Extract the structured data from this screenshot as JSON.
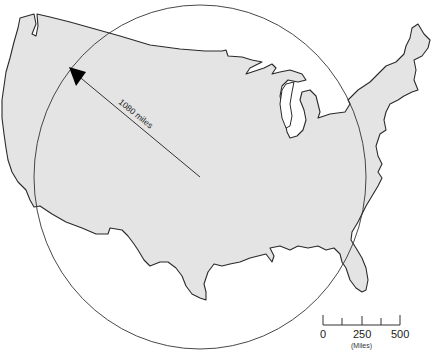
{
  "map": {
    "subject": "Contiguous United States with range circle",
    "land_color": "#e4e4e4",
    "outline_color": "#2a2a2a",
    "background_color": "#ffffff"
  },
  "range_circle": {
    "center_px": [
      200,
      177
    ],
    "radius_px": [
      166,
      172
    ]
  },
  "radius_arrow": {
    "label": "1080 miles",
    "from_px": [
      200,
      177
    ],
    "to_px": [
      70,
      68
    ]
  },
  "scale_bar": {
    "ticks": [
      "0",
      "250",
      "500"
    ],
    "unit_label": "(Miles)"
  }
}
